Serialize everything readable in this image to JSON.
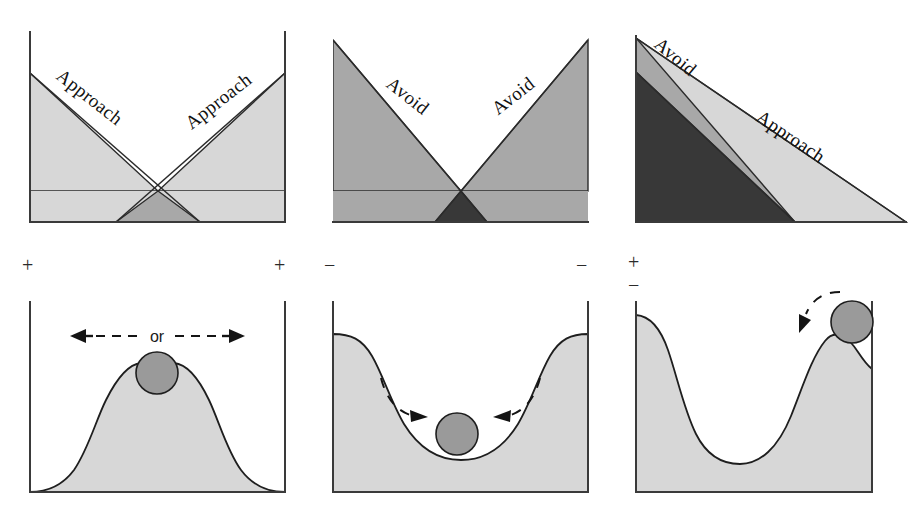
{
  "figure": {
    "width": 917,
    "height": 520,
    "background": "#ffffff",
    "colors": {
      "light_gray": "#d7d7d7",
      "medium_gray": "#a8a8a8",
      "dark_gray": "#383838",
      "ball_gray": "#9a9a9a",
      "ink": "#1e1e1e",
      "axis": "#3a3a3a"
    }
  },
  "columns": [
    {
      "id": "approach-approach",
      "gradient_panel": {
        "labels": [
          {
            "id": "left",
            "text": "Approach",
            "x": 92,
            "y": 108,
            "rotate": 37
          },
          {
            "id": "right",
            "text": "Approach",
            "x": 190,
            "y": 140,
            "rotate": -37
          }
        ],
        "regions": [
          {
            "id": "left-approach-gradient",
            "tone": "light_gray"
          },
          {
            "id": "right-approach-gradient",
            "tone": "light_gray"
          },
          {
            "id": "overlap",
            "tone": "medium_gray"
          }
        ]
      },
      "signs": [
        {
          "id": "left-sign",
          "text": "+",
          "x": 27,
          "y": 271
        },
        {
          "id": "right-sign",
          "text": "+",
          "x": 278,
          "y": 271
        }
      ],
      "terrain_panel": {
        "shape": "double-hump",
        "ball": {
          "cx": 157,
          "cy": 374,
          "r": 21
        },
        "annotation": {
          "text": "or",
          "x": 157,
          "y": 336,
          "arrows": "bidirectional-dashed"
        }
      }
    },
    {
      "id": "avoid-avoid",
      "gradient_panel": {
        "labels": [
          {
            "id": "left",
            "text": "Avoid",
            "x": 402,
            "y": 105,
            "rotate": 37
          },
          {
            "id": "right",
            "text": "Avoid",
            "x": 504,
            "y": 112,
            "rotate": -37
          }
        ],
        "regions": [
          {
            "id": "left-avoid-gradient",
            "tone": "medium_gray"
          },
          {
            "id": "right-avoid-gradient",
            "tone": "medium_gray"
          },
          {
            "id": "overlap",
            "tone": "dark_gray"
          }
        ]
      },
      "signs": [
        {
          "id": "left-sign",
          "text": "−",
          "x": 328,
          "y": 271
        },
        {
          "id": "right-sign",
          "text": "−",
          "x": 580,
          "y": 271
        }
      ],
      "terrain_panel": {
        "shape": "valley-basin",
        "ball": {
          "cx": 457,
          "cy": 434,
          "r": 21
        },
        "annotation": {
          "text": "",
          "arrows": "inward-dashed-arc"
        }
      }
    },
    {
      "id": "approach-avoid",
      "gradient_panel": {
        "labels": [
          {
            "id": "avoid",
            "text": "Avoid",
            "x": 676,
            "y": 80,
            "rotate": 37
          },
          {
            "id": "approach",
            "text": "Approach",
            "x": 790,
            "y": 140,
            "rotate": 29
          }
        ],
        "regions": [
          {
            "id": "approach-gradient",
            "tone": "light_gray"
          },
          {
            "id": "avoid-gradient",
            "tone": "medium_gray"
          },
          {
            "id": "overlap",
            "tone": "dark_gray"
          }
        ]
      },
      "signs": [
        {
          "id": "plus-sign",
          "text": "+",
          "x": 633,
          "y": 268
        },
        {
          "id": "minus-sign",
          "text": "−",
          "x": 633,
          "y": 289
        }
      ],
      "terrain_panel": {
        "shape": "valley-with-right-hill",
        "ball": {
          "cx": 852,
          "cy": 322,
          "r": 21
        },
        "annotation": {
          "text": "",
          "arrows": "down-left-dashed-arc"
        }
      }
    }
  ]
}
